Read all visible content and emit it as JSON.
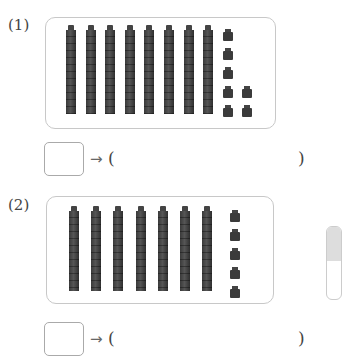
{
  "problems": [
    {
      "label": "(1)",
      "tens_rods": 8,
      "ones_cubes": 7,
      "answer_box_value": "",
      "arrow": "→",
      "paren_open": "(",
      "paren_close": ")",
      "paren_value": ""
    },
    {
      "label": "(2)",
      "tens_rods": 7,
      "ones_cubes": 5,
      "answer_box_value": "",
      "arrow": "→",
      "paren_open": "(",
      "paren_close": ")",
      "paren_value": ""
    }
  ]
}
